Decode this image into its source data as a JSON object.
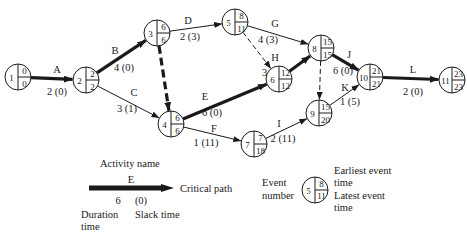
{
  "diagram": {
    "nodes": [
      {
        "id": 1,
        "x": 18,
        "y": 77,
        "earliest": "0",
        "latest": "0"
      },
      {
        "id": 2,
        "x": 86,
        "y": 80,
        "earliest": "2",
        "latest": "2"
      },
      {
        "id": 3,
        "x": 157,
        "y": 33,
        "earliest": "6",
        "latest": "6"
      },
      {
        "id": 4,
        "x": 171,
        "y": 124,
        "earliest": "6",
        "latest": "6"
      },
      {
        "id": 5,
        "x": 235,
        "y": 22,
        "earliest": "8",
        "latest": "11"
      },
      {
        "id": 6,
        "x": 279,
        "y": 79,
        "earliest": "12",
        "latest": "12"
      },
      {
        "id": 7,
        "x": 254,
        "y": 144,
        "earliest": "7",
        "latest": "18"
      },
      {
        "id": 8,
        "x": 321,
        "y": 48,
        "earliest": "15",
        "latest": "15"
      },
      {
        "id": 9,
        "x": 319,
        "y": 113,
        "earliest": "15",
        "latest": "20"
      },
      {
        "id": 10,
        "x": 370,
        "y": 77,
        "earliest": "21",
        "latest": "21"
      },
      {
        "id": 11,
        "x": 452,
        "y": 80,
        "earliest": "23",
        "latest": "23"
      }
    ],
    "activities": [
      {
        "name": "A",
        "from": 1,
        "to": 2,
        "duration": "2",
        "slack": "(0)",
        "critical": true,
        "dummy": false,
        "nx": 57,
        "ny": 73,
        "dx": 57,
        "dy": 95
      },
      {
        "name": "B",
        "from": 2,
        "to": 3,
        "duration": "4",
        "slack": "(0)",
        "critical": true,
        "dummy": false,
        "nx": 115,
        "ny": 54,
        "dx": 124,
        "dy": 71
      },
      {
        "name": "C",
        "from": 2,
        "to": 4,
        "duration": "3",
        "slack": "(1)",
        "critical": false,
        "dummy": false,
        "nx": 134,
        "ny": 96,
        "dx": 127,
        "dy": 112
      },
      {
        "name": "D",
        "from": 3,
        "to": 5,
        "duration": "2",
        "slack": "(3)",
        "critical": false,
        "dummy": false,
        "nx": 188,
        "ny": 24,
        "dx": 190,
        "dy": 40
      },
      {
        "name": "E",
        "from": 4,
        "to": 6,
        "duration": "6",
        "slack": "(0)",
        "critical": true,
        "dummy": false,
        "nx": 205,
        "ny": 100,
        "dx": 212,
        "dy": 116
      },
      {
        "name": "F",
        "from": 4,
        "to": 7,
        "duration": "1",
        "slack": "(11)",
        "critical": false,
        "dummy": false,
        "nx": 214,
        "ny": 132,
        "dx": 206,
        "dy": 146
      },
      {
        "name": "G",
        "from": 5,
        "to": 8,
        "duration": "4",
        "slack": "(3)",
        "critical": false,
        "dummy": false,
        "nx": 275,
        "ny": 27,
        "dx": 268,
        "dy": 43
      },
      {
        "name": "H",
        "from": 6,
        "to": 8,
        "duration": "3",
        "slack": "(0)",
        "critical": true,
        "dummy": false,
        "nx": 275,
        "ny": 61,
        "dx": 272,
        "dy": 76
      },
      {
        "name": "I",
        "from": 7,
        "to": 9,
        "duration": "2",
        "slack": "(11)",
        "critical": false,
        "dummy": false,
        "nx": 279,
        "ny": 127,
        "dx": 283,
        "dy": 142
      },
      {
        "name": "J",
        "from": 8,
        "to": 10,
        "duration": "6",
        "slack": "(0)",
        "critical": true,
        "dummy": false,
        "nx": 349,
        "ny": 58,
        "dx": 343,
        "dy": 74
      },
      {
        "name": "K",
        "from": 9,
        "to": 10,
        "duration": "1",
        "slack": "(5)",
        "critical": false,
        "dummy": false,
        "nx": 345,
        "ny": 91,
        "dx": 350,
        "dy": 105
      },
      {
        "name": "L",
        "from": 10,
        "to": 11,
        "duration": "2",
        "slack": "(0)",
        "critical": true,
        "dummy": false,
        "nx": 413,
        "ny": 73,
        "dx": 413,
        "dy": 95
      },
      {
        "name": "",
        "from": 3,
        "to": 4,
        "duration": "",
        "slack": "",
        "critical": true,
        "dummy": true
      },
      {
        "name": "",
        "from": 5,
        "to": 6,
        "duration": "",
        "slack": "",
        "critical": false,
        "dummy": true
      },
      {
        "name": "",
        "from": 8,
        "to": 9,
        "duration": "",
        "slack": "",
        "critical": false,
        "dummy": true
      }
    ]
  },
  "legend": {
    "activity_name_label": "Activity name",
    "sample_activity": "E",
    "critical_path_label": "Critical path",
    "sample_duration": "6",
    "sample_slack": "(0)",
    "duration_label_1": "Duration",
    "duration_label_2": "time",
    "slack_label": "Slack time",
    "event_number_label_1": "Event",
    "event_number_label_2": "number",
    "sample_event_number": "5",
    "sample_earliest": "8",
    "sample_latest": "11",
    "earliest_label_1": "Earliest event",
    "earliest_label_2": "time",
    "latest_label_1": "Latest event",
    "latest_label_2": "time"
  }
}
